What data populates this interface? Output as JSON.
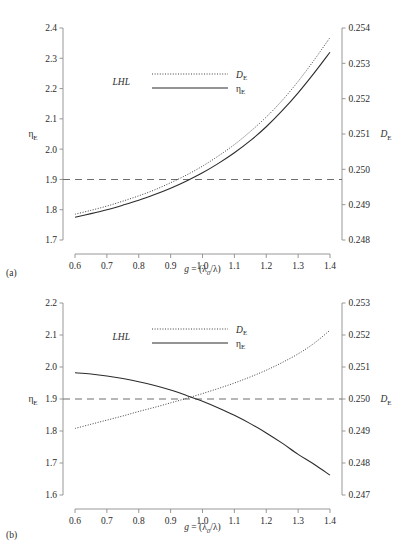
{
  "figure": {
    "width": 416,
    "height": 559,
    "background": "#ffffff",
    "axis_color": "#8c8c8c",
    "curve_color": "#2b2b2b",
    "dash_color": "#6e6e6e"
  },
  "panels": [
    {
      "id": "a",
      "label": "(a)",
      "legend": {
        "group_label": "LHL",
        "entries": [
          {
            "key": "D_E",
            "style": "dotted",
            "label_main": "D",
            "label_sub": "E"
          },
          {
            "key": "eta_E",
            "style": "solid",
            "label_main": "η",
            "label_sub": "E"
          }
        ]
      },
      "axes": {
        "x": {
          "label_main": "g",
          "label_rest": " = (λ",
          "label_sub": "0",
          "label_tail": "/λ)",
          "ticks": [
            "0.6",
            "0.7",
            "0.8",
            "0.9",
            "1.0",
            "1.1",
            "1.2",
            "1.3",
            "1.4"
          ],
          "min": 0.6,
          "max": 1.4
        },
        "y_left": {
          "label_main": "η",
          "label_sub": "E",
          "ticks": [
            "1.7",
            "1.8",
            "1.9",
            "2.0",
            "2.1",
            "2.2",
            "2.3",
            "2.4"
          ],
          "min": 1.7,
          "max": 2.4
        },
        "y_right": {
          "label_main": "D",
          "label_sub": "E",
          "ticks": [
            "0.248",
            "0.249",
            "0.250",
            "0.251",
            "0.252",
            "0.253",
            "0.254"
          ],
          "min": 0.248,
          "max": 0.254
        }
      },
      "reference_line": {
        "y_left_value": 1.9,
        "y_right_value": 0.25,
        "style": "dashed"
      }
    },
    {
      "id": "b",
      "label": "(b)",
      "legend": {
        "group_label": "LHL",
        "entries": [
          {
            "key": "D_E",
            "style": "dotted",
            "label_main": "D",
            "label_sub": "E"
          },
          {
            "key": "eta_E",
            "style": "solid",
            "label_main": "η",
            "label_sub": "E"
          }
        ]
      },
      "axes": {
        "x": {
          "label_main": "g",
          "label_rest": " = (λ",
          "label_sub": "0",
          "label_tail": "/λ)",
          "ticks": [
            "0.6",
            "0.7",
            "0.8",
            "0.9",
            "1.0",
            "1.1",
            "1.2",
            "1.3",
            "1.4"
          ],
          "min": 0.6,
          "max": 1.4
        },
        "y_left": {
          "label_main": "η",
          "label_sub": "E",
          "ticks": [
            "1.6",
            "1.7",
            "1.8",
            "1.9",
            "2.0",
            "2.1",
            "2.2"
          ],
          "min": 1.6,
          "max": 2.2
        },
        "y_right": {
          "label_main": "D",
          "label_sub": "E",
          "ticks": [
            "0.247",
            "0.248",
            "0.249",
            "0.250",
            "0.251",
            "0.252",
            "0.253"
          ],
          "min": 0.247,
          "max": 0.253
        }
      },
      "reference_line": {
        "y_left_value": 1.9,
        "y_right_value": 0.25,
        "style": "dashed"
      }
    }
  ],
  "chart_data": [
    {
      "type": "line",
      "title": "(a)",
      "xlabel": "g = (λ0/λ)",
      "ylabel": "ηE",
      "y2label": "DE",
      "xlim": [
        0.6,
        1.4
      ],
      "ylim": [
        1.7,
        2.4
      ],
      "y2lim": [
        0.248,
        0.254
      ],
      "grid": false,
      "legend_position": "upper-left-inset",
      "legend_group": "LHL",
      "x": [
        0.6,
        0.65,
        0.7,
        0.75,
        0.8,
        0.85,
        0.9,
        0.95,
        1.0,
        1.05,
        1.1,
        1.15,
        1.2,
        1.25,
        1.3,
        1.35,
        1.4
      ],
      "series": [
        {
          "name": "ηE",
          "axis": "left",
          "style": "solid",
          "values": [
            1.775,
            1.787,
            1.8,
            1.815,
            1.831,
            1.85,
            1.871,
            1.895,
            1.922,
            1.953,
            1.988,
            2.028,
            2.074,
            2.127,
            2.186,
            2.251,
            2.32
          ]
        },
        {
          "name": "DE",
          "axis": "right",
          "style": "dotted",
          "values": [
            0.24873,
            0.24884,
            0.24896,
            0.2491,
            0.24925,
            0.24942,
            0.24962,
            0.24984,
            0.25009,
            0.25038,
            0.2507,
            0.25107,
            0.25148,
            0.25195,
            0.25249,
            0.25309,
            0.25373
          ]
        }
      ],
      "reference_line": {
        "value_left": 1.9,
        "value_right": 0.25,
        "style": "dashed"
      }
    },
    {
      "type": "line",
      "title": "(b)",
      "xlabel": "g = (λ0/λ)",
      "ylabel": "ηE",
      "y2label": "DE",
      "xlim": [
        0.6,
        1.4
      ],
      "ylim": [
        1.6,
        2.2
      ],
      "y2lim": [
        0.247,
        0.253
      ],
      "grid": false,
      "legend_position": "upper-left-inset",
      "legend_group": "LHL",
      "x": [
        0.6,
        0.65,
        0.7,
        0.75,
        0.8,
        0.85,
        0.9,
        0.95,
        1.0,
        1.05,
        1.1,
        1.15,
        1.2,
        1.25,
        1.3,
        1.35,
        1.4
      ],
      "series": [
        {
          "name": "ηE",
          "axis": "left",
          "style": "solid",
          "values": [
            1.982,
            1.978,
            1.972,
            1.964,
            1.954,
            1.942,
            1.928,
            1.911,
            1.893,
            1.872,
            1.849,
            1.823,
            1.794,
            1.762,
            1.727,
            1.696,
            1.662
          ]
        },
        {
          "name": "DE",
          "axis": "right",
          "style": "dotted",
          "values": [
            0.24908,
            0.24921,
            0.24934,
            0.24947,
            0.24961,
            0.24974,
            0.24988,
            0.25002,
            0.25017,
            0.25033,
            0.2505,
            0.25069,
            0.2509,
            0.25114,
            0.25141,
            0.25174,
            0.25215
          ]
        }
      ],
      "reference_line": {
        "value_left": 1.9,
        "value_right": 0.25,
        "style": "dashed"
      }
    }
  ]
}
